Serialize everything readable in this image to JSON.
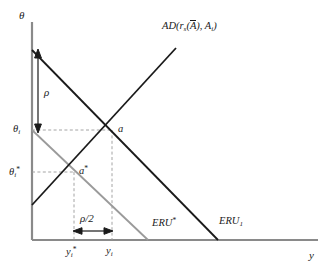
{
  "figure": {
    "type": "economics-line-diagram",
    "background": "#ffffff"
  },
  "axes": {
    "y_axis_label": "θ",
    "x_axis_label": "y",
    "axis_color": "#8a8a8a",
    "origin_px": [
      32,
      240
    ],
    "x_end_px": [
      318,
      240
    ],
    "y_top_px": [
      32,
      22
    ]
  },
  "curves": [
    {
      "name": "ERU1",
      "label_main": "ERU",
      "label_sub": "1",
      "color": "#1a1a1a",
      "style": "solid",
      "slope": "negative",
      "from_px": [
        32,
        50
      ],
      "to_px": [
        218,
        240
      ],
      "label_px": [
        219,
        220
      ]
    },
    {
      "name": "ERU-star",
      "label_main": "ERU",
      "label_sup": "*",
      "color": "#9a9a9a",
      "style": "solid",
      "slope": "negative",
      "from_px": [
        32,
        130
      ],
      "to_px": [
        148,
        240
      ],
      "label_px": [
        152,
        221
      ]
    },
    {
      "name": "AD",
      "label_main": "AD",
      "label_full": "AD(r_s(Ā), A_i)",
      "color": "#1a1a1a",
      "style": "solid",
      "slope": "positive",
      "from_px": [
        32,
        205
      ],
      "to_px": [
        176,
        48
      ],
      "label_px": [
        167,
        27
      ]
    }
  ],
  "ad_label": {
    "prefix": "AD(",
    "r": "r",
    "r_sub": "s",
    "open_paren": "(",
    "abar": "A",
    "close_paren": ")",
    "comma": ", ",
    "A": "A",
    "A_sub": "i",
    "suffix": ")"
  },
  "points": [
    {
      "name": "a",
      "label": "a",
      "px": [
        112,
        130
      ],
      "desc": "intersection of AD and ERU1"
    },
    {
      "name": "a-star",
      "label": "a",
      "label_sup": "*",
      "px": [
        74,
        172
      ],
      "desc": "intersection of AD and ERU*"
    }
  ],
  "ticks": {
    "y": [
      {
        "name": "theta-i",
        "label": "θ",
        "sub": "i",
        "value_px": 130
      },
      {
        "name": "theta-i-star",
        "label": "θ",
        "sub": "i",
        "sup": "*",
        "value_px": 172
      }
    ],
    "x": [
      {
        "name": "y-i-star",
        "label": "y",
        "sub": "i",
        "sup": "*",
        "value_px": 74
      },
      {
        "name": "y-i",
        "label": "y",
        "sub": "i",
        "value_px": 112
      }
    ]
  },
  "annotations": {
    "rho": {
      "name": "rho-vertical-gap",
      "label": "ρ",
      "label_px": [
        44,
        92
      ],
      "arrow_from_px": [
        38,
        52
      ],
      "arrow_to_px": [
        38,
        130
      ],
      "orientation": "vertical",
      "desc": "vertical distance between ERU1 intercept and theta_i"
    },
    "rho_half": {
      "name": "rho-half-horizontal-gap",
      "label_num": "ρ",
      "label_den": "2",
      "label": "ρ/2",
      "label_px": [
        82,
        219
      ],
      "arrow_from_px": [
        74,
        231
      ],
      "arrow_to_px": [
        112,
        231
      ],
      "orientation": "horizontal",
      "desc": "horizontal distance between y_i* and y_i"
    }
  },
  "guides": {
    "color": "#9a9a9a",
    "style": "dashed",
    "lines": [
      {
        "name": "guide-theta-i",
        "from_px": [
          32,
          130
        ],
        "to_px": [
          112,
          130
        ]
      },
      {
        "name": "guide-theta-i-star",
        "from_px": [
          32,
          172
        ],
        "to_px": [
          74,
          172
        ]
      },
      {
        "name": "guide-y-i",
        "from_px": [
          112,
          130
        ],
        "to_px": [
          112,
          240
        ]
      },
      {
        "name": "guide-y-i-star",
        "from_px": [
          74,
          172
        ],
        "to_px": [
          74,
          240
        ]
      }
    ]
  }
}
